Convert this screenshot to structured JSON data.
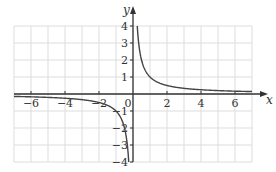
{
  "chart_data": {
    "type": "line",
    "title": "",
    "function": "y = 1/x",
    "xlabel": "x",
    "ylabel": "y",
    "xlim": [
      -7,
      7
    ],
    "ylim": [
      -4,
      4
    ],
    "grid": true,
    "legend": null,
    "x_ticks": [
      -6,
      -4,
      -2,
      0,
      2,
      4,
      6
    ],
    "x_tick_labels": [
      "−6",
      "−4",
      "−2",
      "0",
      "2",
      "4",
      "6"
    ],
    "y_ticks": [
      -4,
      -3,
      -2,
      -1,
      1,
      2,
      3,
      4
    ],
    "y_tick_labels": [
      "−4",
      "−3",
      "−2",
      "−1",
      "1",
      "2",
      "3",
      "4"
    ],
    "series": [
      {
        "name": "y = 1/x (x > 0)",
        "x": [
          0.25,
          0.5,
          1,
          2,
          3,
          4,
          5,
          6,
          7
        ],
        "y": [
          4,
          2,
          1,
          0.5,
          0.333,
          0.25,
          0.2,
          0.167,
          0.143
        ]
      },
      {
        "name": "y = 1/x (x < 0)",
        "x": [
          -7,
          -6,
          -5,
          -4,
          -3,
          -2,
          -1,
          -0.5,
          -0.25
        ],
        "y": [
          -0.143,
          -0.167,
          -0.2,
          -0.25,
          -0.333,
          -0.5,
          -1,
          -2,
          -4
        ]
      }
    ],
    "colors": {
      "curve": "#444444",
      "axes": "#333333",
      "grid": "#dddddd"
    }
  }
}
